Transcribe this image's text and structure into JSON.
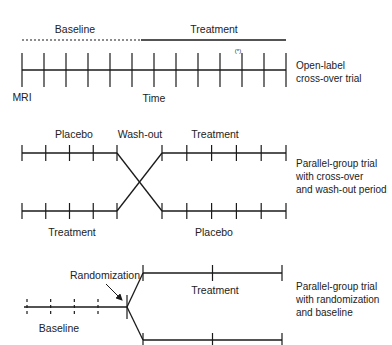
{
  "panels": {
    "open_label": {
      "phase_labels": {
        "baseline": "Baseline",
        "treatment": "Treatment"
      },
      "axis_labels": {
        "start": "MRI",
        "time": "Time"
      },
      "mark": "(*)",
      "description": [
        "Open-label",
        "cross-over trial"
      ],
      "tick_count": 13,
      "baseline_ticks": 6
    },
    "crossover": {
      "labels": {
        "top_left": "Placebo",
        "washout": "Wash-out",
        "top_right": "Treatment",
        "bottom_left": "Treatment",
        "bottom_right": "Placebo"
      },
      "description": [
        "Parallel-group trial",
        "with cross-over",
        "and wash-out period"
      ],
      "left_ticks": 5,
      "right_ticks": 6
    },
    "randomized": {
      "labels": {
        "randomization": "Randomization",
        "baseline": "Baseline",
        "treatment": "Treatment"
      },
      "description": [
        "Parallel-group trial",
        "with randomization",
        "and baseline"
      ],
      "baseline_ticks": 4,
      "branch_ticks": 3
    }
  }
}
